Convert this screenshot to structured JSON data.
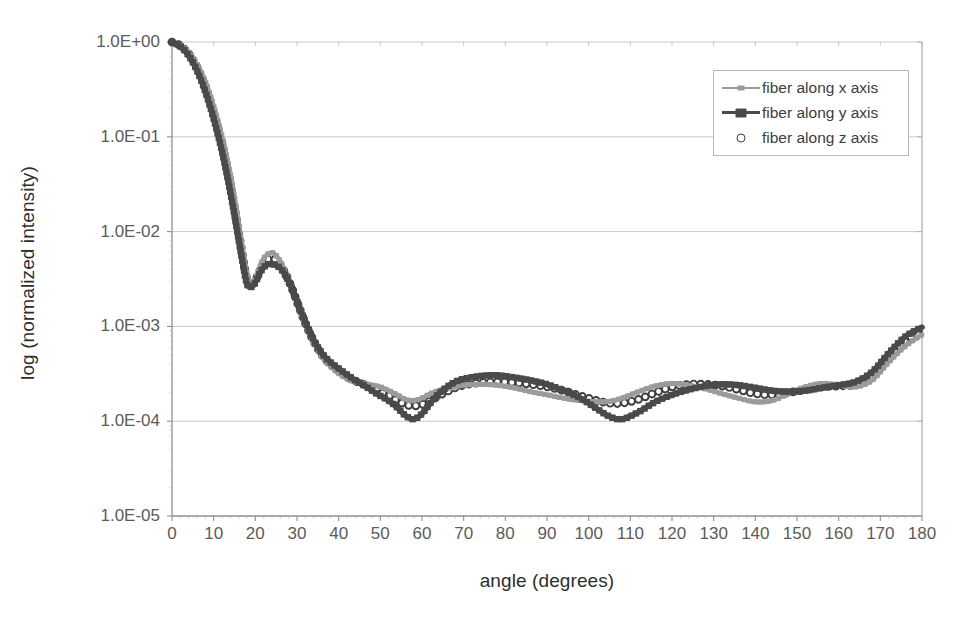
{
  "chart_data": {
    "type": "line",
    "title": "",
    "xlabel": "angle (degrees)",
    "ylabel": "log (normalized intensity)",
    "xlim": [
      0,
      180
    ],
    "ylim": [
      1e-05,
      1
    ],
    "yscale": "log",
    "grid": true,
    "legend_position": "top-right",
    "xticks": [
      0,
      10,
      20,
      30,
      40,
      50,
      60,
      70,
      80,
      90,
      100,
      110,
      120,
      130,
      140,
      150,
      160,
      170,
      180
    ],
    "xtick_labels": [
      "0",
      "10",
      "20",
      "30",
      "40",
      "50",
      "60",
      "70",
      "80",
      "90",
      "100",
      "110",
      "120",
      "130",
      "140",
      "150",
      "160",
      "170",
      "180"
    ],
    "yticks": [
      1,
      0.1,
      0.01,
      0.001,
      0.0001,
      1e-05
    ],
    "ytick_labels": [
      "1.0E+00",
      "1.0E-01",
      "1.0E-02",
      "1.0E-03",
      "1.0E-04",
      "1.0E-05"
    ],
    "x": [
      0,
      2,
      4,
      6,
      8,
      10,
      12,
      14,
      16,
      17,
      18,
      19,
      20,
      21,
      22,
      23,
      24,
      25,
      26,
      27,
      28,
      29,
      30,
      32,
      34,
      36,
      38,
      40,
      42,
      44,
      46,
      48,
      50,
      52,
      54,
      56,
      58,
      60,
      62,
      64,
      66,
      68,
      70,
      74,
      78,
      82,
      86,
      90,
      94,
      98,
      102,
      105,
      108,
      112,
      116,
      120,
      124,
      128,
      132,
      136,
      140,
      144,
      148,
      152,
      156,
      160,
      164,
      168,
      172,
      176,
      180
    ],
    "series": [
      {
        "name": "fiber along x axis",
        "color": "#9b9b9b",
        "marker": "square-small",
        "values": [
          1.0,
          0.93,
          0.78,
          0.58,
          0.38,
          0.21,
          0.1,
          0.04,
          0.012,
          0.0062,
          0.0036,
          0.0029,
          0.0032,
          0.0041,
          0.0052,
          0.0058,
          0.006,
          0.0056,
          0.0048,
          0.0039,
          0.0031,
          0.0024,
          0.0018,
          0.00105,
          0.00068,
          0.00048,
          0.00038,
          0.00032,
          0.00028,
          0.00026,
          0.00025,
          0.00024,
          0.00023,
          0.00021,
          0.00019,
          0.00017,
          0.000165,
          0.000175,
          0.000195,
          0.00021,
          0.00022,
          0.00023,
          0.00024,
          0.000245,
          0.00024,
          0.000225,
          0.000205,
          0.00019,
          0.000175,
          0.000165,
          0.00016,
          0.000162,
          0.000175,
          0.000205,
          0.000235,
          0.00025,
          0.00024,
          0.00022,
          0.000195,
          0.000175,
          0.00016,
          0.000165,
          0.000195,
          0.00023,
          0.00025,
          0.00024,
          0.00023,
          0.00027,
          0.00042,
          0.00062,
          0.00082
        ]
      },
      {
        "name": "fiber along y axis",
        "color": "#4a4a4a",
        "marker": "square",
        "values": [
          1.0,
          0.9,
          0.72,
          0.5,
          0.3,
          0.155,
          0.07,
          0.026,
          0.0082,
          0.0046,
          0.0028,
          0.0026,
          0.0029,
          0.0036,
          0.0042,
          0.0045,
          0.00455,
          0.0044,
          0.0041,
          0.0036,
          0.003,
          0.0024,
          0.00185,
          0.00112,
          0.00072,
          0.00052,
          0.00042,
          0.00036,
          0.00031,
          0.00027,
          0.00024,
          0.00021,
          0.000185,
          0.000165,
          0.00014,
          0.000115,
          0.000105,
          0.00012,
          0.000155,
          0.000195,
          0.00023,
          0.00026,
          0.00028,
          0.0003,
          0.000305,
          0.00029,
          0.00027,
          0.000245,
          0.00021,
          0.000175,
          0.000135,
          0.000112,
          0.000105,
          0.000125,
          0.00016,
          0.00019,
          0.000215,
          0.000235,
          0.000245,
          0.00024,
          0.000225,
          0.00021,
          0.000205,
          0.00021,
          0.000225,
          0.00024,
          0.00026,
          0.00033,
          0.00052,
          0.00078,
          0.00098
        ]
      },
      {
        "name": "fiber along z axis",
        "color": "#3f3f3f",
        "marker": "circle-open",
        "values": [
          1.0,
          0.915,
          0.75,
          0.54,
          0.34,
          0.18,
          0.085,
          0.032,
          0.0098,
          0.0054,
          0.0031,
          0.0027,
          0.00305,
          0.0038,
          0.0047,
          0.0051,
          0.0052,
          0.005,
          0.0045,
          0.00375,
          0.00305,
          0.0024,
          0.00182,
          0.00108,
          0.0007,
          0.0005,
          0.0004,
          0.00034,
          0.000295,
          0.000265,
          0.000245,
          0.000225,
          0.000205,
          0.000185,
          0.000165,
          0.00015,
          0.000145,
          0.00015,
          0.000165,
          0.000185,
          0.000205,
          0.000225,
          0.00024,
          0.000255,
          0.00026,
          0.000255,
          0.000245,
          0.00023,
          0.00021,
          0.000185,
          0.000165,
          0.000155,
          0.000155,
          0.00017,
          0.0002,
          0.00023,
          0.000245,
          0.000245,
          0.000235,
          0.000215,
          0.000195,
          0.00019,
          0.0002,
          0.000215,
          0.00023,
          0.000235,
          0.000245,
          0.0003,
          0.00046,
          0.0007,
          0.00088
        ]
      }
    ]
  },
  "legend": {
    "items": [
      {
        "label": "fiber along x axis"
      },
      {
        "label": "fiber along y axis"
      },
      {
        "label": "fiber along z axis"
      }
    ]
  }
}
